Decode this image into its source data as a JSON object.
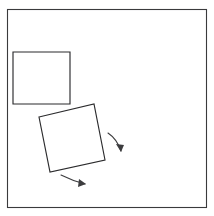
{
  "figure": {
    "background_color": "#ffffff",
    "line_color": "#2b2b2d",
    "frame_color": "#3a3a3c",
    "arrow_color": "#3c3c3e",
    "width": 214,
    "height": 216
  },
  "frame": {
    "label": "outer frame border",
    "x": 7,
    "y": 9,
    "width": 200,
    "height": 199
  },
  "shapes": [
    {
      "id": "square-upright",
      "label": "upright square",
      "rotation_degrees": 0,
      "corners": [
        {
          "x": 13,
          "y": 52
        },
        {
          "x": 70,
          "y": 52
        },
        {
          "x": 70,
          "y": 104
        },
        {
          "x": 13,
          "y": 104
        }
      ]
    },
    {
      "id": "square-rotated",
      "label": "rotated square",
      "rotation_degrees": 11,
      "corners": [
        {
          "x": 39,
          "y": 117
        },
        {
          "x": 94,
          "y": 104
        },
        {
          "x": 105,
          "y": 160
        },
        {
          "x": 50,
          "y": 172
        }
      ]
    }
  ],
  "arrows": [
    {
      "id": "arrow-right",
      "label": "rotation arrow right side",
      "path": "M 108 133 Q 117 139 121 151",
      "head": "121,152 116,144 124,145"
    },
    {
      "id": "arrow-bottom",
      "label": "rotation arrow bottom side",
      "path": "M 61 175 Q 73 181 85 184",
      "head": "86,184 78,187 79,179"
    }
  ]
}
